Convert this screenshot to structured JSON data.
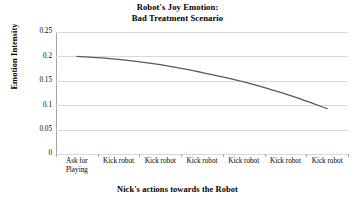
{
  "chart_data": {
    "type": "line",
    "title": "Robot's Joy Emotion: Bad Treatment Scenario",
    "title_line1": "Robot's Joy Emotion:",
    "title_line2": "Bad Treatment Scenario",
    "xlabel": "Nick's actions towards the Robot",
    "ylabel": "Emotion Intensity",
    "categories": [
      "Ask for Playing",
      "Kick robot",
      "Kick robot",
      "Kick robot",
      "Kick robot",
      "Kick robot",
      "Kick robot"
    ],
    "category_lines": [
      [
        "Ask for",
        "Playing"
      ],
      [
        "Kick robot",
        ""
      ],
      [
        "Kick robot",
        ""
      ],
      [
        "Kick robot",
        ""
      ],
      [
        "Kick robot",
        ""
      ],
      [
        "Kick robot",
        ""
      ],
      [
        "Kick robot",
        ""
      ]
    ],
    "values": [
      0.2,
      0.194,
      0.183,
      0.167,
      0.148,
      0.123,
      0.093
    ],
    "ylim": [
      0,
      0.25
    ],
    "yticks": [
      0,
      0.05,
      0.1,
      0.15,
      0.2,
      0.25
    ],
    "ytick_labels": [
      "0",
      "0.05",
      "0.1",
      "0.15",
      "0.2",
      "0.25"
    ],
    "grid": "horizontal",
    "legend": "none",
    "series_color": "#595959",
    "gridline_color": "#d9d9d9",
    "axis_color": "#a6a6a6",
    "background_color": "#ffffff",
    "line_width": 1.3
  }
}
